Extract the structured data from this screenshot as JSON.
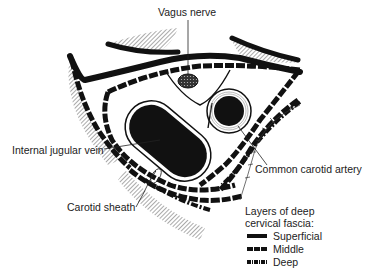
{
  "figure": {
    "labels": {
      "vagus_nerve": "Vagus nerve",
      "internal_jugular_vein": "Internal jugular vein",
      "common_carotid_artery": "Common carotid artery",
      "carotid_sheath": "Carotid sheath"
    },
    "legend": {
      "title_line1": "Layers of deep",
      "title_line2": "cervical fascia:",
      "items": [
        {
          "label": "Superficial",
          "style": "solid"
        },
        {
          "label": "Middle",
          "style": "dashed"
        },
        {
          "label": "Deep",
          "style": "dash-dot"
        }
      ]
    },
    "colors": {
      "ink": "#111111",
      "background": "#ffffff",
      "hatch": "#555555"
    }
  }
}
